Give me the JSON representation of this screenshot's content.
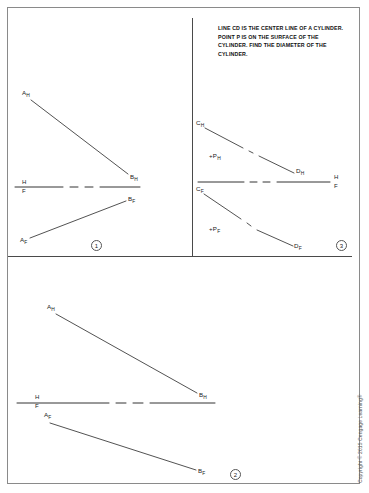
{
  "page": {
    "copyright": "Copyright © 2015 Cengage Learning®",
    "line_color": "#333333",
    "border_color": "#8a8a8a"
  },
  "problem_statement": {
    "text": "LINE CD IS THE CENTER LINE OF A CYLINDER.  POINT P IS ON THE SURFACE OF THE CYLINDER.  FIND THE DIAMETER OF THE CYLINDER."
  },
  "panels": [
    {
      "number": "1",
      "reference_line": {
        "top_label": "H",
        "bottom_label": "F"
      },
      "points": [
        {
          "id": "A_H",
          "base": "A",
          "sub": "H"
        },
        {
          "id": "B_H",
          "base": "B",
          "sub": "H"
        },
        {
          "id": "B_F",
          "base": "B",
          "sub": "F"
        },
        {
          "id": "A_F",
          "base": "A",
          "sub": "F"
        }
      ]
    },
    {
      "number": "3",
      "reference_line": {
        "top_label": "H",
        "bottom_label": "F"
      },
      "points": [
        {
          "id": "C_H",
          "base": "C",
          "sub": "H"
        },
        {
          "id": "D_H",
          "base": "D",
          "sub": "H"
        },
        {
          "id": "P_H",
          "base": "+P",
          "sub": "H"
        },
        {
          "id": "C_F",
          "base": "C",
          "sub": "F"
        },
        {
          "id": "D_F",
          "base": "D",
          "sub": "F"
        },
        {
          "id": "P_F",
          "base": "+P",
          "sub": "F"
        }
      ]
    },
    {
      "number": "2",
      "reference_line": {
        "top_label": "H",
        "bottom_label": "F"
      },
      "points": [
        {
          "id": "A_H",
          "base": "A",
          "sub": "H"
        },
        {
          "id": "B_H",
          "base": "B",
          "sub": "H"
        },
        {
          "id": "A_F",
          "base": "A",
          "sub": "F"
        },
        {
          "id": "B_F",
          "base": "B",
          "sub": "F"
        }
      ]
    }
  ],
  "labels": {
    "p1_AH": "A",
    "p1_AH_sub": "H",
    "p1_BH": "B",
    "p1_BH_sub": "H",
    "p1_BF": "B",
    "p1_BF_sub": "F",
    "p1_AF": "A",
    "p1_AF_sub": "F",
    "p1_H": "H",
    "p1_F": "F",
    "p1_num": "1",
    "p3_CH": "C",
    "p3_CH_sub": "H",
    "p3_DH": "D",
    "p3_DH_sub": "H",
    "p3_PH": "+P",
    "p3_PH_sub": "H",
    "p3_CF": "C",
    "p3_CF_sub": "F",
    "p3_DF": "D",
    "p3_DF_sub": "F",
    "p3_PF": "+P",
    "p3_PF_sub": "F",
    "p3_H": "H",
    "p3_F": "F",
    "p3_num": "3",
    "p2_AH": "A",
    "p2_AH_sub": "H",
    "p2_BH": "B",
    "p2_BH_sub": "H",
    "p2_AF": "A",
    "p2_AF_sub": "F",
    "p2_BF": "B",
    "p2_BF_sub": "F",
    "p2_H": "H",
    "p2_F": "F",
    "p2_num": "2"
  }
}
